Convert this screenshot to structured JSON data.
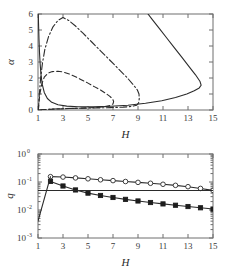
{
  "figure": {
    "background": "#ffffff",
    "curve_color": "#2b2b2b",
    "axis_color": "#6e6e6e"
  },
  "chart_data": [
    {
      "type": "line",
      "panel": "top",
      "title": "",
      "xlabel": "H",
      "ylabel": "α",
      "xlim": [
        1,
        15
      ],
      "ylim": [
        0,
        6
      ],
      "xticks": [
        1,
        3,
        5,
        7,
        9,
        11,
        13,
        15
      ],
      "xticklabels": [
        "1",
        "3",
        "5",
        "7",
        "9",
        "11",
        "13",
        "15"
      ],
      "yticks": [
        0,
        1,
        2,
        3,
        4,
        5,
        6
      ],
      "yticklabels": [
        "0",
        "1",
        "2",
        "3",
        "4",
        "5",
        "6"
      ],
      "grid": false,
      "legend": "none",
      "series": [
        {
          "name": "solid-outer-boundary",
          "style": "solid",
          "points": [
            [
              1.02,
              6.0
            ],
            [
              1.05,
              5.2
            ],
            [
              1.08,
              4.4
            ],
            [
              1.12,
              3.6
            ],
            [
              1.17,
              2.9
            ],
            [
              1.24,
              2.2
            ],
            [
              1.34,
              1.6
            ],
            [
              1.5,
              1.1
            ],
            [
              1.75,
              0.72
            ],
            [
              2.1,
              0.48
            ],
            [
              2.6,
              0.33
            ],
            [
              3.3,
              0.24
            ],
            [
              4.2,
              0.2
            ],
            [
              5.4,
              0.2
            ],
            [
              6.8,
              0.23
            ],
            [
              8.2,
              0.3
            ],
            [
              9.6,
              0.42
            ],
            [
              10.9,
              0.58
            ],
            [
              12.0,
              0.78
            ],
            [
              12.9,
              1.0
            ],
            [
              13.5,
              1.2
            ],
            [
              13.9,
              1.38
            ],
            [
              14.05,
              1.55
            ],
            [
              13.95,
              1.8
            ],
            [
              13.6,
              2.2
            ],
            [
              13.1,
              2.7
            ],
            [
              12.5,
              3.3
            ],
            [
              11.9,
              3.9
            ],
            [
              11.3,
              4.5
            ],
            [
              10.7,
              5.1
            ],
            [
              10.1,
              5.7
            ],
            [
              9.8,
              6.0
            ]
          ]
        },
        {
          "name": "dashdot-middle-boundary",
          "style": "dashdot",
          "points": [
            [
              1.03,
              0.0
            ],
            [
              1.1,
              0.9
            ],
            [
              1.2,
              1.9
            ],
            [
              1.35,
              2.9
            ],
            [
              1.55,
              3.8
            ],
            [
              1.85,
              4.6
            ],
            [
              2.2,
              5.2
            ],
            [
              2.6,
              5.6
            ],
            [
              3.0,
              5.78
            ],
            [
              3.45,
              5.6
            ],
            [
              4.0,
              5.25
            ],
            [
              4.6,
              4.8
            ],
            [
              5.3,
              4.25
            ],
            [
              6.0,
              3.7
            ],
            [
              6.7,
              3.15
            ],
            [
              7.4,
              2.6
            ],
            [
              8.1,
              2.05
            ],
            [
              8.6,
              1.6
            ],
            [
              8.95,
              1.25
            ],
            [
              9.08,
              1.0
            ],
            [
              9.1,
              0.7
            ],
            [
              9.05,
              0.45
            ],
            [
              8.9,
              0.3
            ],
            [
              8.5,
              0.22
            ],
            [
              7.8,
              0.18
            ],
            [
              6.8,
              0.15
            ],
            [
              5.6,
              0.13
            ],
            [
              4.4,
              0.11
            ],
            [
              3.2,
              0.09
            ],
            [
              2.2,
              0.06
            ],
            [
              1.5,
              0.03
            ],
            [
              1.05,
              0.0
            ]
          ]
        },
        {
          "name": "dashed-inner-boundary",
          "style": "dashed",
          "points": [
            [
              1.03,
              0.0
            ],
            [
              1.08,
              0.5
            ],
            [
              1.16,
              1.05
            ],
            [
              1.3,
              1.6
            ],
            [
              1.5,
              2.05
            ],
            [
              1.8,
              2.3
            ],
            [
              2.15,
              2.4
            ],
            [
              2.6,
              2.42
            ],
            [
              3.0,
              2.38
            ],
            [
              3.5,
              2.25
            ],
            [
              4.0,
              2.08
            ],
            [
              4.5,
              1.88
            ],
            [
              5.0,
              1.68
            ],
            [
              5.5,
              1.46
            ],
            [
              6.0,
              1.25
            ],
            [
              6.4,
              1.05
            ],
            [
              6.75,
              0.85
            ],
            [
              6.98,
              0.68
            ],
            [
              7.05,
              0.52
            ],
            [
              7.0,
              0.38
            ],
            [
              6.8,
              0.28
            ],
            [
              6.3,
              0.2
            ],
            [
              5.5,
              0.15
            ],
            [
              4.5,
              0.12
            ],
            [
              3.5,
              0.09
            ],
            [
              2.5,
              0.06
            ],
            [
              1.7,
              0.03
            ],
            [
              1.05,
              0.0
            ]
          ]
        }
      ]
    },
    {
      "type": "line",
      "panel": "bottom",
      "title": "",
      "xlabel": "H",
      "ylabel": "q",
      "yscale": "log",
      "xlim": [
        1,
        15
      ],
      "ylim": [
        0.001,
        1
      ],
      "xticks": [
        1,
        3,
        5,
        7,
        9,
        11,
        13,
        15
      ],
      "xticklabels": [
        "1",
        "3",
        "5",
        "7",
        "9",
        "11",
        "13",
        "15"
      ],
      "yticks": [
        1,
        0.1,
        0.01,
        0.001
      ],
      "yticklabels": [
        "10",
        "10",
        "10",
        "10"
      ],
      "ytickexponents": [
        "0",
        "-1",
        "-2",
        "-3"
      ],
      "grid": false,
      "legend": "none",
      "series": [
        {
          "name": "open-circle-branch",
          "style": "solid",
          "marker": "open-circle",
          "x": [
            2,
            3,
            4,
            5,
            6,
            7,
            8,
            9,
            10,
            11,
            12,
            13,
            14,
            15
          ],
          "y": [
            0.155,
            0.15,
            0.14,
            0.13,
            0.12,
            0.112,
            0.104,
            0.097,
            0.09,
            0.083,
            0.076,
            0.068,
            0.059,
            0.05
          ]
        },
        {
          "name": "filled-square-branch",
          "style": "solid",
          "marker": "filled-square",
          "x": [
            2,
            3,
            4,
            5,
            6,
            7,
            8,
            9,
            10,
            11,
            12,
            13,
            14,
            15
          ],
          "y": [
            0.105,
            0.072,
            0.052,
            0.04,
            0.033,
            0.028,
            0.024,
            0.021,
            0.0185,
            0.0165,
            0.0148,
            0.0133,
            0.012,
            0.0108
          ]
        },
        {
          "name": "rising-line-from-origin",
          "style": "solid",
          "marker": "none",
          "x": [
            1,
            2
          ],
          "y": [
            0.004,
            0.155
          ]
        },
        {
          "name": "horizontal-asymptote-line",
          "style": "solid",
          "marker": "none",
          "x": [
            1,
            15
          ],
          "y": [
            0.05,
            0.05
          ]
        }
      ]
    }
  ]
}
